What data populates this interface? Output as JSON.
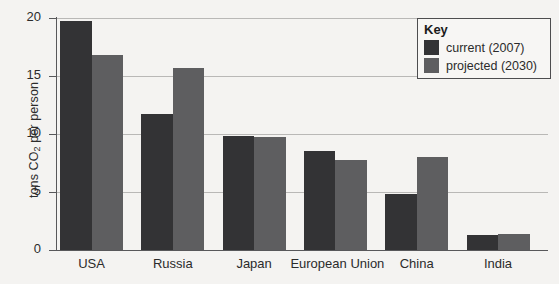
{
  "chart_data": {
    "type": "bar",
    "title": "",
    "xlabel": "",
    "ylabel": "tons CO2 per person",
    "ylabel_parts": {
      "pre": "tons CO",
      "sub": "2",
      "post": " per person"
    },
    "categories": [
      "USA",
      "Russia",
      "Japan",
      "European Union",
      "China",
      "India"
    ],
    "series": [
      {
        "name": "current (2007)",
        "color": "#333335",
        "values": [
          19.7,
          11.7,
          9.8,
          8.5,
          4.8,
          1.3
        ]
      },
      {
        "name": "projected (2030)",
        "color": "#5e5e60",
        "values": [
          16.8,
          15.7,
          9.7,
          7.8,
          8.0,
          1.4
        ]
      }
    ],
    "ylim": [
      0,
      20
    ],
    "yticks": [
      0,
      5,
      10,
      15,
      20
    ],
    "ytick_labels": [
      "0",
      "5",
      "10",
      "15",
      "20"
    ],
    "grid": "horizontal",
    "legend_position": "top-right"
  },
  "legend": {
    "title": "Key",
    "entries": [
      {
        "label": "current (2007)",
        "color": "#333335"
      },
      {
        "label": "projected (2030)",
        "color": "#5e5e60"
      }
    ]
  },
  "colors": {
    "background": "#f4f3f1",
    "axis": "#58585a",
    "gridline": "#b9b8b6",
    "text": "#2b2b2b",
    "current": "#333335",
    "projected": "#5e5e60"
  }
}
